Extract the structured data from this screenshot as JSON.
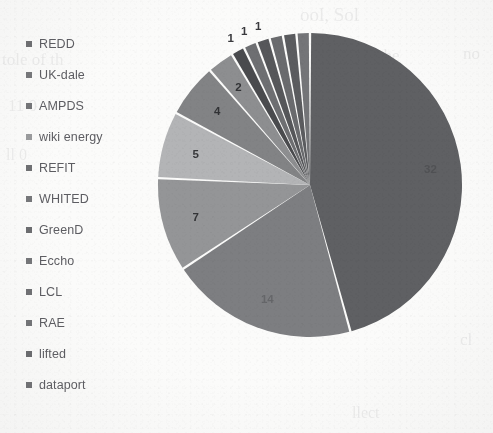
{
  "chart_data": {
    "type": "pie",
    "title": "",
    "legend_position": "left",
    "labels_shown_on_slices": true,
    "total": 68,
    "categories": [
      "REDD",
      "UK-dale",
      "AMPDS",
      "wiki energy",
      "REFIT",
      "WHITED",
      "GreenD",
      "Eccho",
      "LCL",
      "RAE",
      "lifted",
      "dataport"
    ],
    "values": [
      32,
      14,
      7,
      5,
      4,
      2,
      1,
      1,
      1,
      1,
      1,
      1
    ],
    "data_labels": [
      "32",
      "14",
      "7",
      "5",
      "4",
      "2",
      "1",
      "1",
      "1",
      "",
      "",
      ""
    ],
    "series": [
      {
        "name": "dataset usage count",
        "points": [
          {
            "label": "REDD",
            "value": 32,
            "data_label": "32",
            "color": "#5f6063"
          },
          {
            "label": "UK-dale",
            "value": 14,
            "data_label": "14",
            "color": "#7d7e81"
          },
          {
            "label": "AMPDS",
            "value": 7,
            "data_label": "7",
            "color": "#949597"
          },
          {
            "label": "wiki energy",
            "value": 5,
            "data_label": "5",
            "color": "#b3b4b6"
          },
          {
            "label": "REFIT",
            "value": 4,
            "data_label": "4",
            "color": "#828385"
          },
          {
            "label": "WHITED",
            "value": 2,
            "data_label": "2",
            "color": "#8d8e90"
          },
          {
            "label": "GreenD",
            "value": 1,
            "data_label": "1",
            "color": "#4a4b4e"
          },
          {
            "label": "Eccho",
            "value": 1,
            "data_label": "1",
            "color": "#6e6f72"
          },
          {
            "label": "LCL",
            "value": 1,
            "data_label": "1",
            "color": "#56575a"
          },
          {
            "label": "RAE",
            "value": 1,
            "data_label": "",
            "color": "#6a6b6e"
          },
          {
            "label": "lifted",
            "value": 1,
            "data_label": "",
            "color": "#5b5c5f"
          },
          {
            "label": "dataport",
            "value": 1,
            "data_label": "",
            "color": "#747578"
          }
        ]
      }
    ]
  },
  "legend": {
    "items": [
      {
        "label": "REDD",
        "color": "#6e6f72"
      },
      {
        "label": "UK-dale",
        "color": "#76777a"
      },
      {
        "label": "AMPDS",
        "color": "#747578"
      },
      {
        "label": "wiki energy",
        "color": "#9a9b9d"
      },
      {
        "label": "REFIT",
        "color": "#6f7073"
      },
      {
        "label": "WHITED",
        "color": "#76777a"
      },
      {
        "label": "GreenD",
        "color": "#6c6d70"
      },
      {
        "label": "Eccho",
        "color": "#757679"
      },
      {
        "label": "LCL",
        "color": "#6f7073"
      },
      {
        "label": "RAE",
        "color": "#737477"
      },
      {
        "label": "lifted",
        "color": "#6a6b6e"
      },
      {
        "label": "dataport",
        "color": "#707174"
      }
    ]
  },
  "slice_labels": {
    "big": "32",
    "l14": "14",
    "l7": "7",
    "l5": "5",
    "l4": "4",
    "l2": "2",
    "l1a": "1",
    "l1b": "1",
    "l1c": "1"
  },
  "bleed_text": {
    "t1": "ool, Sol",
    "t2": "n the",
    "t3": "no",
    "t4": "tole of th",
    "t5": "11 0",
    "t6": "cl",
    "t7": "ll 0",
    "t8": "llect"
  },
  "colors": {
    "page_background": "#fbfbfa",
    "legend_text": "#5d5d62",
    "label_text": "#3a3a3e",
    "slice_gap": "#fdfdfc"
  }
}
